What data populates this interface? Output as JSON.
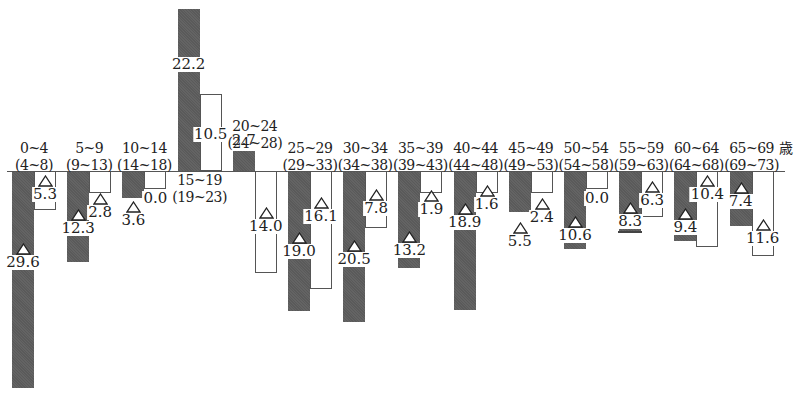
{
  "chart_data": {
    "type": "bar",
    "title": "",
    "unit_label": "歳",
    "xlabel": "Age group (age group 4 years later)",
    "ylabel": "",
    "negative_marker": "△",
    "categories": [
      {
        "top": "0~4",
        "bottom": "(4~8)"
      },
      {
        "top": "5~9",
        "bottom": "(9~13)"
      },
      {
        "top": "10~14",
        "bottom": "(14~18)"
      },
      {
        "top": "15~19",
        "bottom": "(19~23)"
      },
      {
        "top": "20~24",
        "bottom": "(24~28)"
      },
      {
        "top": "25~29",
        "bottom": "(29~33)"
      },
      {
        "top": "30~34",
        "bottom": "(34~38)"
      },
      {
        "top": "35~39",
        "bottom": "(39~43)"
      },
      {
        "top": "40~44",
        "bottom": "(44~48)"
      },
      {
        "top": "45~49",
        "bottom": "(49~53)"
      },
      {
        "top": "50~54",
        "bottom": "(54~58)"
      },
      {
        "top": "55~59",
        "bottom": "(59~63)"
      },
      {
        "top": "60~64",
        "bottom": "(64~68)"
      },
      {
        "top": "65~69",
        "bottom": "(69~73)"
      }
    ],
    "series": [
      {
        "name": "dark (shaded)",
        "color": "#5a5a5a",
        "values": [
          -29.6,
          -12.3,
          -3.6,
          22.2,
          2.7,
          -19.0,
          -20.5,
          -13.2,
          -18.9,
          -5.5,
          -10.6,
          -8.3,
          -9.4,
          -7.4
        ],
        "labels": [
          "29.6",
          "12.3",
          "3.6",
          "22.2",
          "2.7",
          "19.0",
          "20.5",
          "13.2",
          "18.9",
          "5.5",
          "10.6",
          "8.3",
          "9.4",
          "7.4"
        ]
      },
      {
        "name": "white (outline)",
        "color": "#ffffff",
        "values": [
          -5.3,
          -2.8,
          0.0,
          10.5,
          -14.0,
          -16.1,
          -7.8,
          -1.9,
          -1.6,
          -2.4,
          0.0,
          -6.3,
          -10.4,
          -11.6
        ],
        "labels": [
          "5.3",
          "2.8",
          "0.0",
          "10.5",
          "14.0",
          "16.1",
          "7.8",
          "1.9",
          "1.6",
          "2.4",
          "0.0",
          "6.3",
          "10.4",
          "11.6"
        ]
      }
    ],
    "grid": false,
    "legend": null
  }
}
